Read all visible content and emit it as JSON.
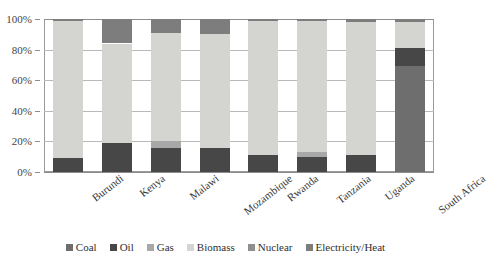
{
  "chart_data": {
    "type": "bar",
    "subtype": "stacked-100-percent",
    "title": "",
    "subtitle": "",
    "xlabel": "",
    "ylabel": "",
    "ylim": [
      0,
      100
    ],
    "ytick_labels": [
      "0%",
      "20%",
      "40%",
      "60%",
      "80%",
      "100%"
    ],
    "ytick_values": [
      0,
      20,
      40,
      60,
      80,
      100
    ],
    "grid": true,
    "legend_position": "bottom",
    "categories": [
      "Burundi",
      "Kenya",
      "Malawi",
      "Mozambique",
      "Rwanda",
      "Tanzania",
      "Uganda",
      "South Africa"
    ],
    "series": [
      {
        "name": "Coal",
        "color": "#6e6e6e",
        "values": [
          0,
          0,
          0,
          0,
          0,
          0,
          0,
          69
        ]
      },
      {
        "name": "Oil",
        "color": "#474747",
        "values": [
          9,
          19,
          16,
          16,
          11,
          10,
          11,
          12
        ]
      },
      {
        "name": "Gas",
        "color": "#a8a8a8",
        "values": [
          0,
          0,
          4,
          0,
          0,
          3,
          0,
          0
        ]
      },
      {
        "name": "Biomass",
        "color": "#d4d4d0",
        "values": [
          90,
          65,
          71,
          74,
          88,
          86,
          87,
          17
        ]
      },
      {
        "name": "Nuclear",
        "color": "#8f8f8f",
        "values": [
          0,
          0,
          0,
          0,
          0,
          0,
          0,
          0
        ]
      },
      {
        "name": "Electricity/Heat",
        "color": "#7d7d7d",
        "values": [
          1,
          16,
          9,
          10,
          1,
          1,
          2,
          2
        ]
      }
    ]
  }
}
